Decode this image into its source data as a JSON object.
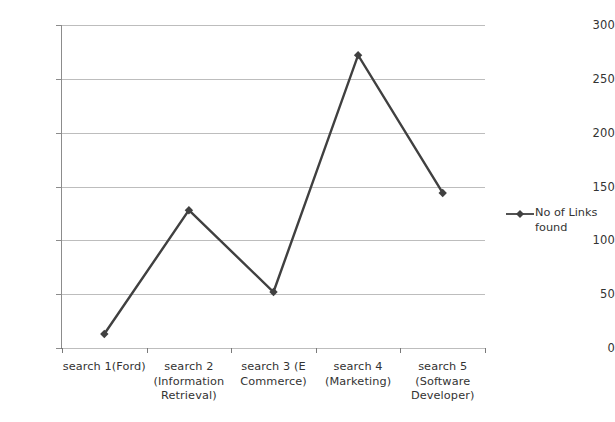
{
  "chart_data": {
    "type": "line",
    "title": "",
    "xlabel": "",
    "ylabel": "",
    "ylim": [
      0,
      300
    ],
    "yticks": [
      0,
      50,
      100,
      150,
      200,
      250,
      300
    ],
    "grid": true,
    "legend_position": "right",
    "categories": [
      "search 1(Ford)",
      "search 2 (Information Retrieval)",
      "search 3 (E Commerce)",
      "search 4 (Marketing)",
      "search 5 (Software Developer)"
    ],
    "category_lines": [
      [
        "search 1(Ford)"
      ],
      [
        "search 2",
        "(Information",
        "Retrieval)"
      ],
      [
        "search 3 (E",
        "Commerce)"
      ],
      [
        "search 4",
        "(Marketing)"
      ],
      [
        "search 5",
        "(Software",
        "Developer)"
      ]
    ],
    "series": [
      {
        "name": "No of Links found",
        "values": [
          13,
          128,
          52,
          272,
          144
        ],
        "color": "#404040",
        "marker": "diamond"
      }
    ]
  },
  "legend": {
    "entries": [
      {
        "label_lines": [
          "No of Links",
          "found"
        ],
        "label": "No of Links found",
        "color": "#404040"
      }
    ]
  },
  "axis": {
    "y_tick_labels": [
      "300",
      "250",
      "200",
      "150",
      "100",
      "50",
      "0"
    ]
  },
  "colors": {
    "series": "#404040",
    "gridline": "#bdbdbd",
    "axis": "#7a7a7a",
    "text": "#333333",
    "background": "#ffffff"
  }
}
